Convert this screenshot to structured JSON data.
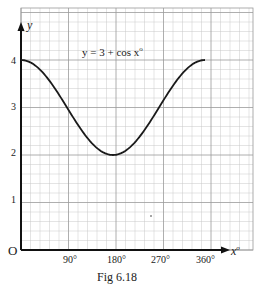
{
  "chart_data": {
    "type": "line",
    "caption": "Fig 6.18",
    "xlabel": "x°",
    "ylabel": "y",
    "origin_label": "O",
    "x_ticks": [
      "90°",
      "180°",
      "270°",
      "360°"
    ],
    "x_tick_values": [
      90,
      180,
      270,
      360
    ],
    "y_ticks": [
      "1",
      "2",
      "3",
      "4"
    ],
    "y_tick_values": [
      1,
      2,
      3,
      4
    ],
    "xlim": [
      0,
      375
    ],
    "ylim": [
      0,
      5
    ],
    "grid": true,
    "series": [
      {
        "name": "y = 3 + cos x°",
        "x": [
          0,
          30,
          60,
          90,
          120,
          150,
          180,
          210,
          240,
          270,
          300,
          330,
          360
        ],
        "y": [
          4,
          3.87,
          3.5,
          3,
          2.5,
          2.13,
          2,
          2.13,
          2.5,
          3,
          3.5,
          3.87,
          4
        ]
      }
    ]
  },
  "labels": {
    "equation_lhs": "y = 3 + cos x",
    "equation_sup": "o",
    "y_axis": "y",
    "x_axis": "x",
    "x_axis_sup": "o",
    "origin": "O",
    "caption": "Fig 6.18",
    "ytick_1": "1",
    "ytick_2": "2",
    "ytick_3": "3",
    "ytick_4": "4",
    "xtick_90": "90°",
    "xtick_180": "180°",
    "xtick_270": "270°",
    "xtick_360": "360°"
  }
}
